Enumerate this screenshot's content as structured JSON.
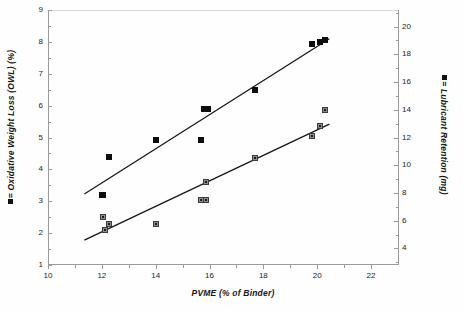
{
  "figure": {
    "background": "#fefefe",
    "frame_color": "#9a9a9a"
  },
  "axes": {
    "x": {
      "title": "PVME (% of Binder)",
      "min": 10,
      "max": 23,
      "ticks": [
        10,
        12,
        14,
        16,
        18,
        20,
        22
      ],
      "tick_labels": [
        "10",
        "12",
        "14",
        "16",
        "18",
        "20",
        "22"
      ],
      "minor_ticks": [
        11,
        13,
        15,
        17,
        19,
        21
      ]
    },
    "y_left": {
      "title": "= Oxidative Weight Loss (OWL) (%)",
      "legend_marker": "filled-square",
      "min": 1,
      "max": 9,
      "ticks": [
        1,
        2,
        3,
        4,
        5,
        6,
        7,
        8,
        9
      ],
      "tick_labels": [
        "1",
        "2",
        "3",
        "4",
        "5",
        "6",
        "7",
        "8",
        "9"
      ],
      "minor_ticks": [
        1.5,
        2.5,
        3.5,
        4.5,
        5.5,
        6.5,
        7.5,
        8.5
      ]
    },
    "y_right": {
      "title": "= Lubricant Retention (mg)",
      "legend_marker": "filled-square",
      "min": 2.8,
      "max": 21.2,
      "ticks": [
        4,
        6,
        8,
        10,
        12,
        14,
        16,
        18,
        20
      ],
      "tick_labels": [
        "4",
        "6",
        "8",
        "10",
        "12",
        "14",
        "16",
        "18",
        "20"
      ],
      "minor_ticks": [
        3,
        5,
        7,
        9,
        11,
        13,
        15,
        17,
        19,
        21
      ]
    }
  },
  "chart_data": {
    "type": "scatter",
    "title": "",
    "xlabel": "PVME (% of Binder)",
    "ylabel": "Oxidative Weight Loss (OWL) (%)",
    "ylabel_secondary": "Lubricant Retention (mg)",
    "xlim": [
      10,
      23
    ],
    "ylim": [
      1,
      9
    ],
    "ylim_secondary": [
      2.8,
      21.2
    ],
    "grid": false,
    "legend_position": "axis-labels",
    "series": [
      {
        "name": "Oxidative Weight Loss (OWL) (%)",
        "axis": "left",
        "marker": "filled-square",
        "color": "#0d0d0d",
        "x": [
          12.0,
          12.05,
          12.25,
          14.0,
          15.7,
          15.8,
          15.95,
          17.7,
          19.8,
          20.1,
          20.3
        ],
        "y": [
          3.2,
          3.2,
          4.4,
          4.93,
          4.93,
          5.9,
          5.9,
          6.5,
          7.92,
          8.0,
          8.05
        ],
        "trendline": {
          "x1": 11.35,
          "y1": 3.23,
          "x2": 20.45,
          "y2": 8.1
        }
      },
      {
        "name": "Lubricant Retention (mg)",
        "axis": "right",
        "marker": "open-square",
        "color": "#8e8e8e",
        "x": [
          12.05,
          12.1,
          12.25,
          14.0,
          15.7,
          15.85,
          15.85,
          17.7,
          19.8,
          20.1,
          20.3
        ],
        "y_left_scale": [
          2.5,
          2.1,
          2.3,
          2.3,
          3.03,
          3.05,
          3.6,
          4.35,
          5.05,
          5.35,
          5.85
        ],
        "y": [
          6.2,
          5.3,
          5.75,
          5.75,
          7.45,
          7.5,
          8.75,
          10.5,
          12.1,
          12.8,
          14.0
        ],
        "trendline": {
          "x1": 11.35,
          "y1": 1.78,
          "x2": 20.45,
          "y2": 5.42
        }
      }
    ]
  }
}
